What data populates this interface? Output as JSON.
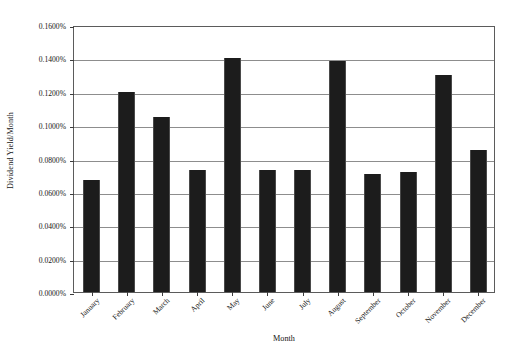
{
  "chart_data": {
    "type": "bar",
    "title": "",
    "xlabel": "Month",
    "ylabel": "Dividend Yield/Month",
    "categories": [
      "January",
      "February",
      "March",
      "April",
      "May",
      "June",
      "July",
      "August",
      "September",
      "October",
      "November",
      "December"
    ],
    "values": [
      0.067,
      0.12,
      0.105,
      0.073,
      0.14,
      0.073,
      0.073,
      0.1385,
      0.071,
      0.072,
      0.13,
      0.085
    ],
    "value_unit": "%",
    "value_labels": [
      "0.0670%",
      "0.1200%",
      "0.1050%",
      "0.0730%",
      "0.1400%",
      "0.0730%",
      "0.0730%",
      "0.1385%",
      "0.0710%",
      "0.0720%",
      "0.1300%",
      "0.0850%"
    ],
    "ylim": [
      0.0,
      0.16
    ],
    "ytick_values": [
      0.16,
      0.14,
      0.12,
      0.1,
      0.08,
      0.06,
      0.04,
      0.02,
      0.0
    ],
    "ytick_labels": [
      "0.1600%",
      "0.1400%",
      "0.1200%",
      "0.1000%",
      "0.0800%",
      "0.0600%",
      "0.0400%",
      "0.0200%",
      "0.0000%"
    ],
    "grid": true,
    "grid_axis": "y",
    "legend": false,
    "legend_position": "none",
    "bar_color": "#1c1c1c",
    "frame_color": "#5b5b5b",
    "gridline_color": "#8d8d8d",
    "background_color": "#ffffff",
    "xtick_label_rotation": -45
  }
}
